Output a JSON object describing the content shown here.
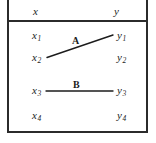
{
  "figure": {
    "type": "relation-mapping-diagram",
    "header": {
      "left_column": "x",
      "right_column": "y"
    },
    "left_items": [
      {
        "base": "x",
        "subscript": "1"
      },
      {
        "base": "x",
        "subscript": "2"
      },
      {
        "base": "x",
        "subscript": "3"
      },
      {
        "base": "x",
        "subscript": "4"
      }
    ],
    "right_items": [
      {
        "base": "y",
        "subscript": "1"
      },
      {
        "base": "y",
        "subscript": "2"
      },
      {
        "base": "y",
        "subscript": "3"
      },
      {
        "base": "y",
        "subscript": "4"
      }
    ],
    "edges": [
      {
        "label": "A",
        "from": "x2",
        "to": "y1"
      },
      {
        "label": "B",
        "from": "x3",
        "to": "y3"
      }
    ],
    "colors": {
      "border": "#2b2b2b",
      "text": "#1c1c1c",
      "edge": "#1c1c1c",
      "background": "#ffffff"
    }
  }
}
